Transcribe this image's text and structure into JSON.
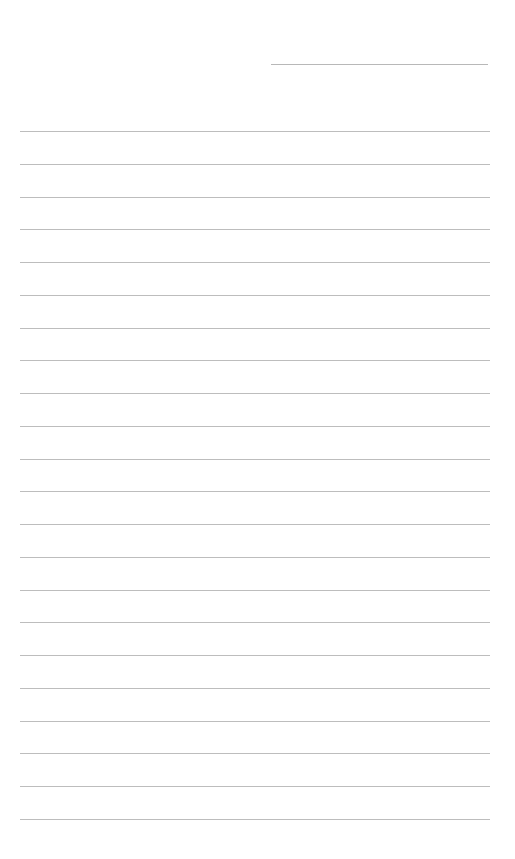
{
  "page": {
    "type": "lined-writing-page",
    "background_color": "#ffffff",
    "line_color": "#bdbdbd"
  },
  "header": {
    "left_text": "",
    "right_text": ""
  },
  "top_short_line": {
    "x_start": 271,
    "x_end": 488,
    "y": 64
  },
  "ruled_lines": {
    "count": 22,
    "x_start": 20,
    "x_end": 490,
    "first_y": 131,
    "spacing": 32.75
  }
}
